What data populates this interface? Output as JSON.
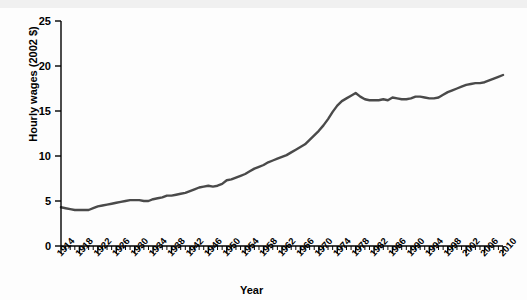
{
  "chart_data": {
    "type": "line",
    "title": "",
    "xlabel": "Year",
    "ylabel": "Hourly wages (2002 $)",
    "ylim": [
      0,
      25
    ],
    "xlim": [
      1914,
      2010
    ],
    "yticks": [
      0,
      5,
      10,
      15,
      20,
      25
    ],
    "xticks": [
      1914,
      1918,
      1922,
      1926,
      1930,
      1934,
      1938,
      1942,
      1946,
      1950,
      1954,
      1958,
      1962,
      1966,
      1970,
      1974,
      1978,
      1982,
      1986,
      1990,
      1994,
      1998,
      2002,
      2006,
      2010
    ],
    "grid": false,
    "legend": "none",
    "line_color": "#4a4a4a",
    "axis_color": "#000000",
    "background": "#ffffff",
    "x": [
      1914,
      1915,
      1916,
      1917,
      1918,
      1919,
      1920,
      1921,
      1922,
      1923,
      1924,
      1925,
      1926,
      1927,
      1928,
      1929,
      1930,
      1931,
      1932,
      1933,
      1934,
      1935,
      1936,
      1937,
      1938,
      1939,
      1940,
      1941,
      1942,
      1943,
      1944,
      1945,
      1946,
      1947,
      1948,
      1949,
      1950,
      1951,
      1952,
      1953,
      1954,
      1955,
      1956,
      1957,
      1958,
      1959,
      1960,
      1961,
      1962,
      1963,
      1964,
      1965,
      1966,
      1967,
      1968,
      1969,
      1970,
      1971,
      1972,
      1973,
      1974,
      1975,
      1976,
      1977,
      1978,
      1979,
      1980,
      1981,
      1982,
      1983,
      1984,
      1985,
      1986,
      1987,
      1988,
      1989,
      1990,
      1991,
      1992,
      1993,
      1994,
      1995,
      1996,
      1997,
      1998,
      1999,
      2000,
      2001,
      2002,
      2003,
      2004,
      2005,
      2006,
      2007,
      2008,
      2009,
      2010
    ],
    "y": [
      4.3,
      4.2,
      4.1,
      4.0,
      4.0,
      4.0,
      4.0,
      4.2,
      4.4,
      4.5,
      4.6,
      4.7,
      4.8,
      4.9,
      5.0,
      5.1,
      5.1,
      5.1,
      5.0,
      5.0,
      5.2,
      5.3,
      5.4,
      5.6,
      5.6,
      5.7,
      5.8,
      5.9,
      6.1,
      6.3,
      6.5,
      6.6,
      6.7,
      6.6,
      6.7,
      6.9,
      7.3,
      7.4,
      7.6,
      7.8,
      8.0,
      8.3,
      8.6,
      8.8,
      9.0,
      9.3,
      9.5,
      9.7,
      9.9,
      10.1,
      10.4,
      10.7,
      11.0,
      11.3,
      11.8,
      12.3,
      12.8,
      13.4,
      14.1,
      14.9,
      15.6,
      16.1,
      16.4,
      16.7,
      17.0,
      16.6,
      16.3,
      16.2,
      16.2,
      16.2,
      16.3,
      16.2,
      16.5,
      16.4,
      16.3,
      16.3,
      16.4,
      16.6,
      16.6,
      16.5,
      16.4,
      16.4,
      16.5,
      16.8,
      17.1,
      17.3,
      17.5,
      17.7,
      17.9,
      18.0,
      18.1,
      18.1,
      18.2,
      18.4,
      18.6,
      18.8,
      19.0
    ]
  }
}
